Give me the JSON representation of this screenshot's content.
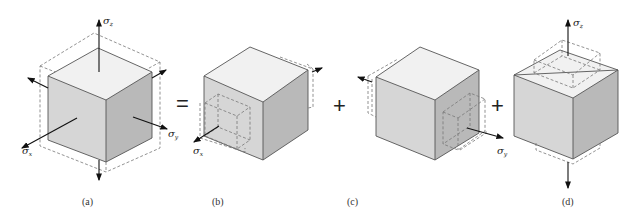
{
  "diagram": {
    "panels": [
      {
        "id": "a",
        "caption": "(a)",
        "labels": {
          "sigma_x": "σ",
          "sigma_x_sub": "x",
          "sigma_y": "σ",
          "sigma_y_sub": "y",
          "sigma_z": "σ",
          "sigma_z_sub": "z"
        }
      },
      {
        "id": "b",
        "caption": "(b)",
        "labels": {
          "sigma_x": "σ",
          "sigma_x_sub": "x"
        }
      },
      {
        "id": "c",
        "caption": "(c)",
        "labels": {
          "sigma_y": "σ",
          "sigma_y_sub": "y"
        }
      },
      {
        "id": "d",
        "caption": "(d)",
        "labels": {
          "sigma_z": "σ",
          "sigma_z_sub": "z"
        }
      }
    ],
    "operators": [
      "=",
      "+",
      "+"
    ],
    "colors": {
      "face_front": "#d6d6d6",
      "face_right": "#b9b9b9",
      "face_top": "#f1f1f1",
      "edge": "#555555",
      "arrow": "#111111"
    }
  }
}
